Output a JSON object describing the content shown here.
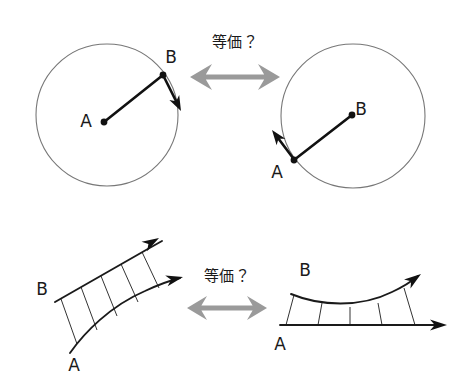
{
  "figure": {
    "canvas": {
      "width": 465,
      "height": 384
    },
    "background_color": "#ffffff",
    "stroke_color": "#111111",
    "circle_stroke_color": "#777777",
    "arrow_gray_color": "#9a9a9a"
  },
  "top_row": {
    "equiv_label": "等価？",
    "equiv_label_pos": {
      "x": 235,
      "y": 42
    },
    "biarrow": {
      "name": "double-headed-arrow",
      "cx": 235,
      "cy": 77,
      "half_width": 45,
      "shaft_half_height": 2.5,
      "head_half_height": 13,
      "head_length": 22,
      "color": "#9a9a9a"
    },
    "left_circle": {
      "center": {
        "x": 107,
        "y": 115
      },
      "radius": 71,
      "points": [
        {
          "id": "A",
          "label": "A",
          "x": 104,
          "y": 122,
          "label_x": 86,
          "label_y": 122,
          "on_circle": false,
          "dot_r": 3.4
        },
        {
          "id": "B",
          "label": "B",
          "x": 163,
          "y": 75,
          "label_x": 171,
          "label_y": 58,
          "on_circle": true,
          "dot_r": 3.4
        }
      ],
      "vectors": [
        {
          "name": "radius-vector-a-to-b",
          "from": {
            "x": 104,
            "y": 122
          },
          "to": {
            "x": 163,
            "y": 75
          },
          "arrowhead": false
        },
        {
          "name": "tangent-vector-at-b",
          "from": {
            "x": 164,
            "y": 77
          },
          "to": {
            "x": 181,
            "y": 111
          },
          "arrowhead": true
        }
      ]
    },
    "right_circle": {
      "center": {
        "x": 353,
        "y": 116
      },
      "radius": 72,
      "points": [
        {
          "id": "A",
          "label": "A",
          "x": 294,
          "y": 160,
          "label_x": 277,
          "label_y": 173,
          "on_circle": true,
          "dot_r": 3.4
        },
        {
          "id": "B",
          "label": "B",
          "x": 352,
          "y": 115,
          "label_x": 361,
          "label_y": 110,
          "on_circle": false,
          "dot_r": 3.4
        }
      ],
      "vectors": [
        {
          "name": "radius-vector-a-to-b",
          "from": {
            "x": 294,
            "y": 160
          },
          "to": {
            "x": 352,
            "y": 115
          },
          "arrowhead": false
        },
        {
          "name": "tangent-vector-at-a",
          "from": {
            "x": 293,
            "y": 158
          },
          "to": {
            "x": 272,
            "y": 130
          },
          "arrowhead": true
        }
      ]
    }
  },
  "bottom_row": {
    "equiv_label": "等価？",
    "equiv_label_pos": {
      "x": 227,
      "y": 276
    },
    "biarrow": {
      "name": "double-headed-arrow",
      "cx": 227,
      "cy": 308,
      "half_width": 40,
      "shaft_half_height": 2.5,
      "head_half_height": 12,
      "head_length": 20,
      "color": "#9a9a9a"
    },
    "left_ladder": {
      "name": "tilted-curved-ladder",
      "labels": [
        {
          "id": "B",
          "label": "B",
          "x": 42,
          "y": 290
        },
        {
          "id": "A",
          "label": "A",
          "x": 74,
          "y": 366
        }
      ],
      "rail_top": {
        "name": "upper-rail",
        "path": "M 55 302 L 146 250 L 162 241",
        "head": {
          "tip": {
            "x": 159,
            "y": 238
          },
          "angle_deg": -30,
          "length": 17,
          "half_width": 5.5
        }
      },
      "rail_bottom": {
        "name": "lower-rail",
        "path": "M 70 353 C 84 333 110 306 145 291 C 160 284 172 280 180 278",
        "head": {
          "tip": {
            "x": 183,
            "y": 277
          },
          "angle_deg": -13,
          "length": 17,
          "half_width": 5.5
        }
      },
      "rungs": [
        {
          "x1": 61,
          "y1": 299,
          "x2": 77,
          "y2": 344
        },
        {
          "x1": 81,
          "y1": 287,
          "x2": 97,
          "y2": 330
        },
        {
          "x1": 101,
          "y1": 276,
          "x2": 117,
          "y2": 316
        },
        {
          "x1": 121,
          "y1": 264,
          "x2": 138,
          "y2": 302
        },
        {
          "x1": 142,
          "y1": 252,
          "x2": 159,
          "y2": 288
        }
      ]
    },
    "right_ladder": {
      "name": "flat-curved-ladder",
      "labels": [
        {
          "id": "B",
          "label": "B",
          "x": 305,
          "y": 271
        },
        {
          "id": "A",
          "label": "A",
          "x": 280,
          "y": 345
        }
      ],
      "rail_top": {
        "name": "upper-curved-rail",
        "path": "M 291 294 C 320 306 360 308 392 292 C 405 286 412 281 418 276",
        "head": {
          "tip": {
            "x": 421,
            "y": 274
          },
          "angle_deg": -36,
          "length": 17,
          "half_width": 5.5
        }
      },
      "rail_bottom": {
        "name": "lower-straight-rail",
        "path": "M 280 325 L 443 325",
        "head": {
          "tip": {
            "x": 447,
            "y": 325
          },
          "angle_deg": 0,
          "length": 17,
          "half_width": 5.5
        }
      },
      "rungs": [
        {
          "x1": 294,
          "y1": 295,
          "x2": 286,
          "y2": 325
        },
        {
          "x1": 322,
          "y1": 303,
          "x2": 318,
          "y2": 325
        },
        {
          "x1": 350,
          "y1": 307,
          "x2": 350,
          "y2": 325
        },
        {
          "x1": 378,
          "y1": 303,
          "x2": 382,
          "y2": 325
        },
        {
          "x1": 404,
          "y1": 288,
          "x2": 415,
          "y2": 325
        }
      ]
    }
  }
}
